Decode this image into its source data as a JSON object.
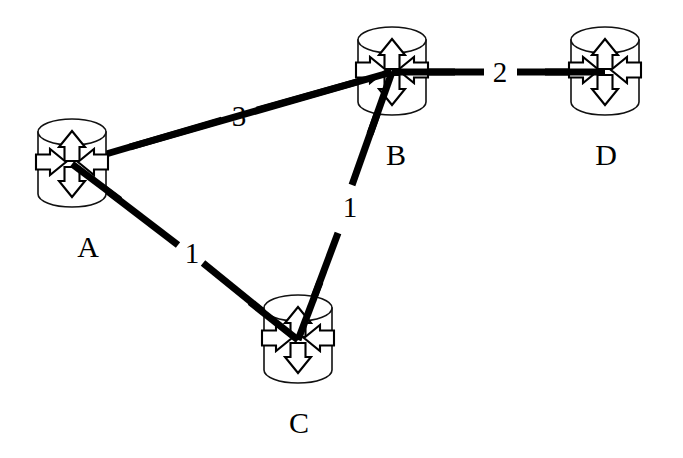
{
  "diagram": {
    "type": "node-link-graph",
    "background_color": "#ffffff",
    "line_color": "#000000",
    "node_icon": "router-cylinder-icon",
    "nodes": [
      {
        "id": "A",
        "label": "A",
        "cx": 72,
        "cy": 164,
        "label_x": 88,
        "label_y": 257
      },
      {
        "id": "B",
        "label": "B",
        "cx": 392,
        "cy": 72,
        "label_x": 396,
        "label_y": 165
      },
      {
        "id": "C",
        "label": "C",
        "cx": 298,
        "cy": 340,
        "label_x": 299,
        "label_y": 433
      },
      {
        "id": "D",
        "label": "D",
        "cx": 605,
        "cy": 72,
        "label_x": 606,
        "label_y": 165
      }
    ],
    "edges": [
      {
        "id": "A-B",
        "from": "A",
        "to": "B",
        "weight": "3",
        "label_x": 239,
        "label_y": 126
      },
      {
        "id": "B-D",
        "from": "B",
        "to": "D",
        "weight": "2",
        "label_x": 500,
        "label_y": 82
      },
      {
        "id": "A-C",
        "from": "A",
        "to": "C",
        "weight": "1",
        "label_x": 192,
        "label_y": 263
      },
      {
        "id": "C-B",
        "from": "C",
        "to": "B",
        "weight": "1",
        "label_x": 350,
        "label_y": 217
      }
    ]
  }
}
